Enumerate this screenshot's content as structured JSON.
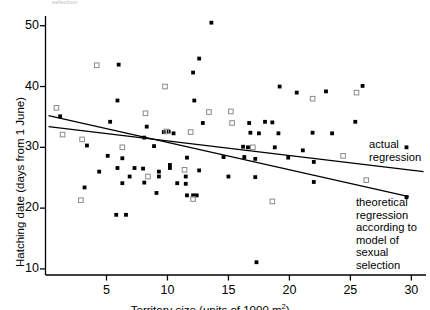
{
  "figure": {
    "top_cut_note": "selection",
    "background": "#ffffff",
    "ink": "#000000"
  },
  "annotations": [
    {
      "name": "actual-regression-label",
      "text": "actual\nregression",
      "x": 369,
      "y": 138
    },
    {
      "name": "theoretical-regression-label",
      "text": "theoretical\nregression\naccording to\nmodel of sexual\nselection",
      "x": 356,
      "y": 196
    }
  ],
  "chart_data": {
    "type": "scatter",
    "title": "",
    "xlabel": "Territory size (units of 1000 m²)",
    "ylabel": "Hatching date (days from 1 June)",
    "xlim": [
      0,
      31.2
    ],
    "ylim": [
      9.0,
      51.6
    ],
    "xticks": [
      5,
      10,
      15,
      20,
      25,
      30
    ],
    "yticks": [
      10,
      20,
      30,
      40,
      50
    ],
    "grid": false,
    "legend_position": "inside-right-as-text-annotations",
    "axis_style": "left-and-bottom-spines-only",
    "series": [
      {
        "name": "filled-markers",
        "marker": "filled",
        "color": "#000000",
        "points": [
          [
            13.6,
            50.5
          ],
          [
            6.0,
            43.6
          ],
          [
            12.6,
            44.6
          ],
          [
            12.1,
            42.3
          ],
          [
            1.2,
            35.1
          ],
          [
            5.9,
            37.7
          ],
          [
            12.2,
            37.7
          ],
          [
            19.2,
            40.0
          ],
          [
            20.6,
            39.0
          ],
          [
            26.0,
            40.1
          ],
          [
            23.0,
            39.2
          ],
          [
            5.3,
            34.2
          ],
          [
            8.3,
            33.4
          ],
          [
            12.9,
            34.0
          ],
          [
            16.7,
            34.0
          ],
          [
            18.0,
            34.2
          ],
          [
            18.6,
            34.1
          ],
          [
            25.4,
            34.2
          ],
          [
            16.8,
            32.4
          ],
          [
            17.5,
            32.3
          ],
          [
            19.1,
            32.3
          ],
          [
            21.9,
            32.4
          ],
          [
            23.5,
            32.3
          ],
          [
            8.1,
            31.6
          ],
          [
            9.7,
            32.5
          ],
          [
            10.1,
            32.6
          ],
          [
            10.5,
            32.3
          ],
          [
            3.4,
            30.3
          ],
          [
            8.9,
            30.2
          ],
          [
            16.2,
            30.1
          ],
          [
            16.6,
            30.0
          ],
          [
            18.8,
            30.0
          ],
          [
            21.1,
            29.5
          ],
          [
            29.6,
            30.0
          ],
          [
            5.1,
            28.6
          ],
          [
            6.3,
            28.2
          ],
          [
            11.6,
            28.3
          ],
          [
            14.6,
            28.4
          ],
          [
            16.3,
            28.4
          ],
          [
            17.2,
            28.1
          ],
          [
            19.9,
            28.3
          ],
          [
            22.0,
            27.6
          ],
          [
            5.9,
            26.6
          ],
          [
            7.3,
            26.6
          ],
          [
            10.2,
            26.6
          ],
          [
            6.9,
            25.2
          ],
          [
            9.3,
            25.2
          ],
          [
            11.5,
            25.2
          ],
          [
            15.0,
            25.2
          ],
          [
            17.2,
            25.1
          ],
          [
            22.0,
            24.3
          ],
          [
            29.6,
            21.8
          ],
          [
            4.4,
            26.0
          ],
          [
            8.0,
            26.5
          ],
          [
            9.3,
            26.0
          ],
          [
            10.2,
            27.1
          ],
          [
            12.6,
            26.2
          ],
          [
            3.2,
            23.4
          ],
          [
            6.3,
            24.1
          ],
          [
            8.1,
            24.2
          ],
          [
            10.8,
            24.1
          ],
          [
            11.5,
            24.0
          ],
          [
            9.1,
            22.5
          ],
          [
            11.6,
            22.1
          ],
          [
            12.1,
            22.1
          ],
          [
            12.4,
            22.1
          ],
          [
            5.8,
            18.9
          ],
          [
            6.6,
            18.9
          ],
          [
            17.3,
            11.1
          ]
        ]
      },
      {
        "name": "open-square-markers",
        "marker": "open-square",
        "color": "#8a8a8a",
        "points": [
          [
            0.9,
            36.5
          ],
          [
            4.2,
            43.5
          ],
          [
            9.8,
            40.0
          ],
          [
            8.2,
            35.6
          ],
          [
            13.4,
            35.8
          ],
          [
            15.2,
            35.9
          ],
          [
            21.9,
            38.0
          ],
          [
            25.5,
            39.0
          ],
          [
            3.0,
            31.3
          ],
          [
            9.9,
            32.6
          ],
          [
            11.9,
            32.5
          ],
          [
            1.4,
            32.1
          ],
          [
            6.3,
            30.0
          ],
          [
            17.0,
            30.0
          ],
          [
            15.3,
            34.0
          ],
          [
            24.4,
            28.6
          ],
          [
            11.4,
            26.3
          ],
          [
            8.4,
            25.2
          ],
          [
            26.3,
            24.6
          ],
          [
            2.9,
            21.3
          ],
          [
            12.1,
            21.5
          ],
          [
            18.6,
            21.1
          ]
        ]
      }
    ],
    "regression_lines": [
      {
        "name": "actual-regression-line",
        "x0": 0.25,
        "y0": 33.4,
        "x1": 31.0,
        "y1": 26.0
      },
      {
        "name": "theoretical-regression-line",
        "x0": 0.25,
        "y0": 35.2,
        "x1": 29.8,
        "y1": 21.9
      }
    ]
  }
}
